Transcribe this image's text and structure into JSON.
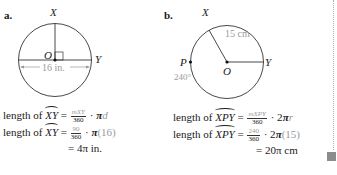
{
  "part_a": {
    "label": "a.",
    "point_x": "X",
    "point_y": "Y",
    "center": "O",
    "diameter_label": "16 in.",
    "eq1": {
      "lhs_prefix": "length of ",
      "arc": "XY",
      "eq": " = ",
      "num": "mXY",
      "den": "360",
      "rest_op": " · ",
      "rest_pi": "π",
      "rest_var": "d"
    },
    "eq2": {
      "lhs_prefix": "length of ",
      "arc": "XY",
      "eq": " = ",
      "num": "90",
      "den": "360",
      "rest_op": " · ",
      "rest_pi": "π",
      "rest_val": "(16)"
    },
    "eq3": {
      "eq": "= ",
      "result": "4π in."
    }
  },
  "part_b": {
    "label": "b.",
    "point_x": "X",
    "point_y": "Y",
    "point_p": "P",
    "center": "O",
    "radius_label": "15 cm",
    "angle_label": "240°",
    "eq1": {
      "lhs_prefix": "length of ",
      "arc": "XPY",
      "eq": " = ",
      "num": "mXPY",
      "den": "360",
      "rest_op": " · 2",
      "rest_pi": "π",
      "rest_var": "r"
    },
    "eq2": {
      "lhs_prefix": "length of ",
      "arc": "XPY",
      "eq": " = ",
      "num": "240",
      "den": "360",
      "rest_op": " · 2",
      "rest_pi": "π",
      "rest_val": "(15)"
    },
    "eq3": {
      "eq": "= ",
      "result": "20π cm"
    }
  },
  "colors": {
    "ink": "#1a1a1a",
    "gray_text": "#9a9a9a",
    "marker": "#8c8c8c"
  }
}
